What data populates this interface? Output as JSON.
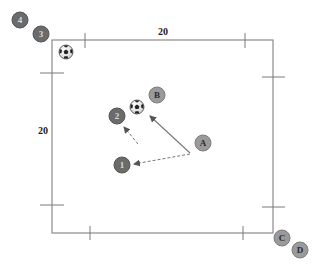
{
  "diagram": {
    "type": "soccer-drill",
    "field": {
      "width_label": "20",
      "height_label": "20",
      "line_color": "#8a8a8a"
    },
    "colors": {
      "team_numbers_fill": "#6b6b6b",
      "team_numbers_stroke": "#555555",
      "team_numbers_text": "#d9d9d9",
      "team_letters_fill": "#9a9a9a",
      "team_letters_stroke": "#7d7d7d",
      "team_letters_text": "#2a2a2a",
      "arrow_color": "#777777"
    },
    "players": [
      {
        "id": "4",
        "label": "4",
        "team": "numbers"
      },
      {
        "id": "3",
        "label": "3",
        "team": "numbers"
      },
      {
        "id": "2",
        "label": "2",
        "team": "numbers"
      },
      {
        "id": "1",
        "label": "1",
        "team": "numbers"
      },
      {
        "id": "B",
        "label": "B",
        "team": "letters"
      },
      {
        "id": "A",
        "label": "A",
        "team": "letters"
      },
      {
        "id": "C",
        "label": "C",
        "team": "letters"
      },
      {
        "id": "D",
        "label": "D",
        "team": "letters"
      }
    ],
    "balls": [
      {
        "id": "ball-corner",
        "near": "3"
      },
      {
        "id": "ball-center",
        "near": "B"
      }
    ],
    "movements": [
      {
        "from": "A",
        "to": "B",
        "style": "solid",
        "meaning": "run"
      },
      {
        "from": "A",
        "to": "1",
        "style": "dashed",
        "meaning": "pass"
      },
      {
        "from": "open-space",
        "to": "2",
        "style": "dashed",
        "meaning": "pass"
      }
    ]
  }
}
